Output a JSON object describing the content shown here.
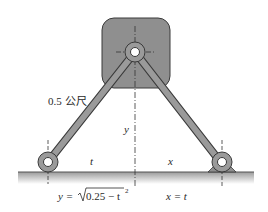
{
  "diagram": {
    "rod_length_label": "0.5 公尺",
    "vertical_label": "y",
    "left_horizontal_label": "t",
    "right_horizontal_label": "x",
    "equation_y": {
      "lhs": "y = ",
      "radicand": "0.25 − t",
      "exponent": "2"
    },
    "equation_x": "x = t",
    "colors": {
      "block_fill": "#8f8f8f",
      "block_stroke": "#3a3a3a",
      "rod_fill": "#9a9a9a",
      "ground": "#b0b0b0",
      "text": "#2a2a2a"
    }
  }
}
